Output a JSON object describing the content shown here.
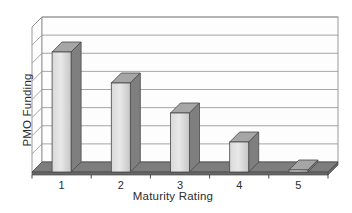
{
  "figure": {
    "background": "#ffffff"
  },
  "chart_data": {
    "type": "bar",
    "style": "3d-column",
    "title": "",
    "xlabel": "Maturity Rating",
    "ylabel": "PMO Funding",
    "categories": [
      "1",
      "2",
      "3",
      "4",
      "5"
    ],
    "values": [
      120,
      89,
      59,
      30,
      2
    ],
    "values_unit": "bar front-face height in px; y-axis shows no numeric tick labels",
    "values_relative": [
      1.0,
      0.74,
      0.49,
      0.25,
      0.02
    ],
    "y_axis_tick_labels": [],
    "gridline_intervals": 8,
    "grid": "horizontal",
    "legend_position": "none",
    "colors": {
      "bar_front": "#d9d9d9",
      "bar_front_light": "#e8e8e8",
      "bar_front_dark": "#c6c6c6",
      "bar_top": "#a6a6a6",
      "bar_side": "#7f7f7f",
      "floor_top": "#7d7d7d",
      "floor_edge": "#676767",
      "wall_fill": "#fdfdfd",
      "gridline": "#8f8f8f",
      "outline": "#474747",
      "text": "#2b2b2b"
    }
  }
}
